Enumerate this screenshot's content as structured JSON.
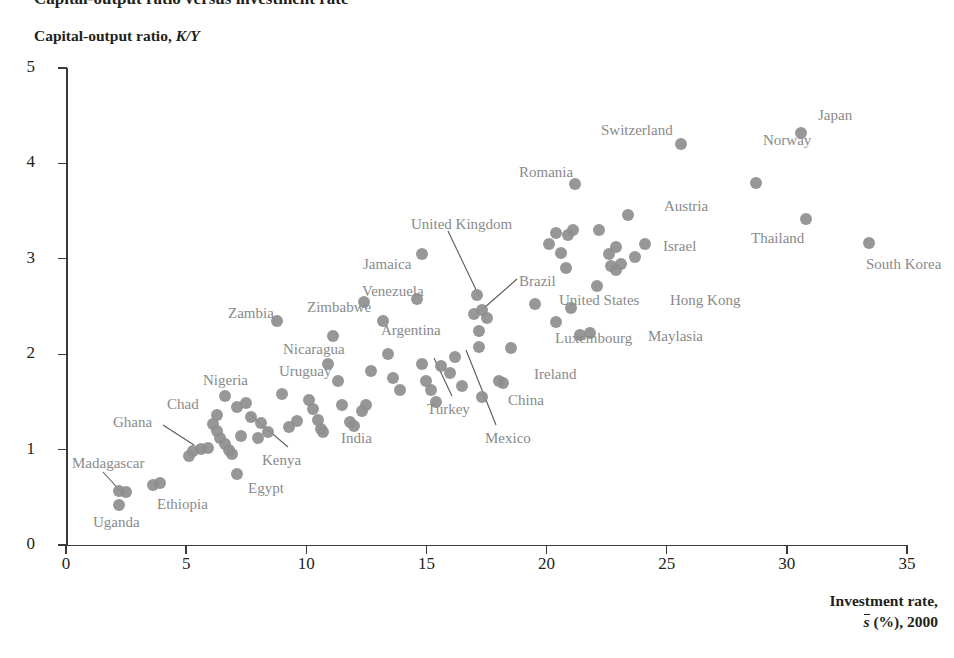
{
  "title_cut": "Capital-output ratio versus investment rate",
  "axes": {
    "ylabel_text": "Capital-output ratio, ",
    "ylabel_italic": "K/Y",
    "xlabel_line1": "Investment rate,",
    "xlabel_svar": "s",
    "xlabel_rest": " (%), 2000",
    "yticks": [
      "0",
      "1",
      "2",
      "3",
      "4",
      "5"
    ],
    "xticks": [
      "0",
      "5",
      "10",
      "15",
      "20",
      "25",
      "30",
      "35"
    ]
  },
  "style": {
    "marker_color": "#8e8e8e",
    "label_color": "#8a8a8a",
    "axis_color": "#3a3a3a",
    "text_color": "#231f20",
    "background": "#ffffff"
  },
  "chart_data": {
    "type": "scatter",
    "title": "Capital-output ratio versus investment rate",
    "xlabel": "Investment rate, s-bar (%), 2000",
    "ylabel": "Capital-output ratio, K/Y",
    "xlim": [
      0,
      35
    ],
    "ylim": [
      0,
      5
    ],
    "xticks": [
      0,
      5,
      10,
      15,
      20,
      25,
      30,
      35
    ],
    "yticks": [
      0,
      1,
      2,
      3,
      4,
      5
    ],
    "grid": false,
    "legend": "none",
    "marker": "filled-circle",
    "points": [
      {
        "label": "Uganda",
        "x": 2.2,
        "y": 0.42,
        "labeled": true
      },
      {
        "label": "Madagascar",
        "x": 2.2,
        "y": 0.57,
        "labeled": true
      },
      {
        "label": "",
        "x": 2.5,
        "y": 0.56,
        "labeled": false
      },
      {
        "label": "Ethiopia",
        "x": 3.6,
        "y": 0.63,
        "labeled": true
      },
      {
        "label": "",
        "x": 3.9,
        "y": 0.65,
        "labeled": false
      },
      {
        "label": "Ghana",
        "x": 5.3,
        "y": 0.99,
        "labeled": true
      },
      {
        "label": "",
        "x": 5.6,
        "y": 1.01,
        "labeled": false
      },
      {
        "label": "",
        "x": 5.9,
        "y": 1.02,
        "labeled": false
      },
      {
        "label": "",
        "x": 5.1,
        "y": 0.93,
        "labeled": false
      },
      {
        "label": "Chad",
        "x": 6.1,
        "y": 1.27,
        "labeled": true
      },
      {
        "label": "",
        "x": 6.3,
        "y": 1.19,
        "labeled": false
      },
      {
        "label": "",
        "x": 6.4,
        "y": 1.12,
        "labeled": false
      },
      {
        "label": "",
        "x": 6.6,
        "y": 1.06,
        "labeled": false
      },
      {
        "label": "",
        "x": 6.8,
        "y": 1.0,
        "labeled": false
      },
      {
        "label": "",
        "x": 6.9,
        "y": 0.95,
        "labeled": false
      },
      {
        "label": "Nigeria",
        "x": 6.6,
        "y": 1.56,
        "labeled": true
      },
      {
        "label": "",
        "x": 6.3,
        "y": 1.36,
        "labeled": false
      },
      {
        "label": "",
        "x": 7.1,
        "y": 1.45,
        "labeled": false
      },
      {
        "label": "Egypt",
        "x": 7.1,
        "y": 0.74,
        "labeled": true
      },
      {
        "label": "Kenya",
        "x": 7.3,
        "y": 1.14,
        "labeled": true
      },
      {
        "label": "",
        "x": 7.5,
        "y": 1.49,
        "labeled": false
      },
      {
        "label": "",
        "x": 7.7,
        "y": 1.34,
        "labeled": false
      },
      {
        "label": "",
        "x": 8.0,
        "y": 1.12,
        "labeled": false
      },
      {
        "label": "",
        "x": 8.1,
        "y": 1.28,
        "labeled": false
      },
      {
        "label": "",
        "x": 8.4,
        "y": 1.18,
        "labeled": false
      },
      {
        "label": "Zambia",
        "x": 8.8,
        "y": 2.35,
        "labeled": true
      },
      {
        "label": "",
        "x": 9.0,
        "y": 1.58,
        "labeled": false
      },
      {
        "label": "",
        "x": 9.3,
        "y": 1.24,
        "labeled": false
      },
      {
        "label": "",
        "x": 9.6,
        "y": 1.3,
        "labeled": false
      },
      {
        "label": "Uruguay",
        "x": 10.1,
        "y": 1.52,
        "labeled": true
      },
      {
        "label": "",
        "x": 10.3,
        "y": 1.43,
        "labeled": false
      },
      {
        "label": "",
        "x": 10.5,
        "y": 1.31,
        "labeled": false
      },
      {
        "label": "",
        "x": 10.6,
        "y": 1.22,
        "labeled": false
      },
      {
        "label": "",
        "x": 10.7,
        "y": 1.18,
        "labeled": false
      },
      {
        "label": "Nicaragua",
        "x": 10.9,
        "y": 1.9,
        "labeled": true
      },
      {
        "label": "Zimbabwe",
        "x": 11.1,
        "y": 2.19,
        "labeled": true
      },
      {
        "label": "",
        "x": 11.3,
        "y": 1.72,
        "labeled": false
      },
      {
        "label": "",
        "x": 11.5,
        "y": 1.47,
        "labeled": false
      },
      {
        "label": "India",
        "x": 11.8,
        "y": 1.29,
        "labeled": true
      },
      {
        "label": "",
        "x": 12.0,
        "y": 1.25,
        "labeled": false
      },
      {
        "label": "",
        "x": 12.3,
        "y": 1.4,
        "labeled": false
      },
      {
        "label": "",
        "x": 12.5,
        "y": 1.47,
        "labeled": false
      },
      {
        "label": "Venezuela",
        "x": 12.4,
        "y": 2.55,
        "labeled": true
      },
      {
        "label": "",
        "x": 12.7,
        "y": 1.82,
        "labeled": false
      },
      {
        "label": "Argentina",
        "x": 13.2,
        "y": 2.35,
        "labeled": true
      },
      {
        "label": "",
        "x": 13.4,
        "y": 2.0,
        "labeled": false
      },
      {
        "label": "",
        "x": 13.6,
        "y": 1.75,
        "labeled": false
      },
      {
        "label": "",
        "x": 13.9,
        "y": 1.62,
        "labeled": false
      },
      {
        "label": "Jamaica",
        "x": 14.8,
        "y": 3.05,
        "labeled": true
      },
      {
        "label": "",
        "x": 14.6,
        "y": 2.58,
        "labeled": false
      },
      {
        "label": "",
        "x": 14.8,
        "y": 1.9,
        "labeled": false
      },
      {
        "label": "",
        "x": 15.0,
        "y": 1.72,
        "labeled": false
      },
      {
        "label": "",
        "x": 15.2,
        "y": 1.62,
        "labeled": false
      },
      {
        "label": "",
        "x": 15.4,
        "y": 1.5,
        "labeled": false
      },
      {
        "label": "",
        "x": 15.6,
        "y": 1.88,
        "labeled": false
      },
      {
        "label": "Turkey",
        "x": 16.0,
        "y": 1.8,
        "labeled": true
      },
      {
        "label": "",
        "x": 16.2,
        "y": 1.97,
        "labeled": false
      },
      {
        "label": "",
        "x": 16.5,
        "y": 1.67,
        "labeled": false
      },
      {
        "label": "United Kingdom",
        "x": 17.1,
        "y": 2.62,
        "labeled": true
      },
      {
        "label": "Brazil",
        "x": 17.3,
        "y": 2.46,
        "labeled": true
      },
      {
        "label": "",
        "x": 17.0,
        "y": 2.42,
        "labeled": false
      },
      {
        "label": "",
        "x": 17.2,
        "y": 2.24,
        "labeled": false
      },
      {
        "label": "Mexico",
        "x": 17.2,
        "y": 2.08,
        "labeled": true
      },
      {
        "label": "",
        "x": 17.5,
        "y": 2.38,
        "labeled": false
      },
      {
        "label": "",
        "x": 17.3,
        "y": 1.55,
        "labeled": false
      },
      {
        "label": "China",
        "x": 18.0,
        "y": 1.72,
        "labeled": true
      },
      {
        "label": "",
        "x": 18.2,
        "y": 1.7,
        "labeled": false
      },
      {
        "label": "Ireland",
        "x": 18.5,
        "y": 2.07,
        "labeled": true
      },
      {
        "label": "",
        "x": 19.5,
        "y": 2.53,
        "labeled": false
      },
      {
        "label": "",
        "x": 20.1,
        "y": 3.15,
        "labeled": false
      },
      {
        "label": "",
        "x": 20.4,
        "y": 3.27,
        "labeled": false
      },
      {
        "label": "",
        "x": 20.6,
        "y": 3.06,
        "labeled": false
      },
      {
        "label": "",
        "x": 20.9,
        "y": 3.25,
        "labeled": false
      },
      {
        "label": "",
        "x": 21.1,
        "y": 3.3,
        "labeled": false
      },
      {
        "label": "",
        "x": 20.8,
        "y": 2.9,
        "labeled": false
      },
      {
        "label": "Romania",
        "x": 21.2,
        "y": 3.78,
        "labeled": true
      },
      {
        "label": "United States",
        "x": 21.0,
        "y": 2.48,
        "labeled": true
      },
      {
        "label": "Brazil-pt",
        "x": 20.4,
        "y": 2.34,
        "labeled": false
      },
      {
        "label": "Luxembourg",
        "x": 21.4,
        "y": 2.2,
        "labeled": true
      },
      {
        "label": "",
        "x": 22.2,
        "y": 3.3,
        "labeled": false
      },
      {
        "label": "",
        "x": 22.6,
        "y": 3.05,
        "labeled": false
      },
      {
        "label": "",
        "x": 22.9,
        "y": 3.12,
        "labeled": false
      },
      {
        "label": "",
        "x": 22.7,
        "y": 2.92,
        "labeled": false
      },
      {
        "label": "",
        "x": 23.1,
        "y": 2.95,
        "labeled": false
      },
      {
        "label": "",
        "x": 22.9,
        "y": 2.88,
        "labeled": false
      },
      {
        "label": "Hong Kong",
        "x": 22.1,
        "y": 2.71,
        "labeled": true
      },
      {
        "label": "Maylasia",
        "x": 21.8,
        "y": 2.22,
        "labeled": true
      },
      {
        "label": "Austria",
        "x": 23.4,
        "y": 3.46,
        "labeled": true
      },
      {
        "label": "Israel",
        "x": 23.7,
        "y": 3.02,
        "labeled": true
      },
      {
        "label": "",
        "x": 24.1,
        "y": 3.15,
        "labeled": false
      },
      {
        "label": "Switzerland",
        "x": 25.6,
        "y": 4.2,
        "labeled": true
      },
      {
        "label": "Norway",
        "x": 28.7,
        "y": 3.79,
        "labeled": true
      },
      {
        "label": "Thailand",
        "x": 30.8,
        "y": 3.42,
        "labeled": true
      },
      {
        "label": "Japan",
        "x": 30.6,
        "y": 4.32,
        "labeled": true
      },
      {
        "label": "South Korea",
        "x": 33.4,
        "y": 3.17,
        "labeled": true
      }
    ],
    "annotations": [
      {
        "text": "Madagascar",
        "leader": true
      },
      {
        "text": "Ghana",
        "leader": true
      },
      {
        "text": "Kenya",
        "leader": true
      },
      {
        "text": "United Kingdom",
        "leader": true
      },
      {
        "text": "Brazil",
        "leader": true
      },
      {
        "text": "Turkey",
        "leader": true
      },
      {
        "text": "Mexico",
        "leader": true
      }
    ]
  },
  "point_labels": [
    {
      "name": "Madagascar",
      "text": "Madagascar",
      "left": 72,
      "top": 455
    },
    {
      "name": "Uganda",
      "text": "Uganda",
      "left": 93,
      "top": 514
    },
    {
      "name": "Ethiopia",
      "text": "Ethiopia",
      "left": 157,
      "top": 496
    },
    {
      "name": "Ghana",
      "text": "Ghana",
      "left": 113,
      "top": 414
    },
    {
      "name": "Chad",
      "text": "Chad",
      "left": 167,
      "top": 396
    },
    {
      "name": "Nigeria",
      "text": "Nigeria",
      "left": 203,
      "top": 372
    },
    {
      "name": "Kenya",
      "text": "Kenya",
      "left": 262,
      "top": 452
    },
    {
      "name": "Egypt",
      "text": "Egypt",
      "left": 248,
      "top": 480
    },
    {
      "name": "Zambia",
      "text": "Zambia",
      "left": 228,
      "top": 305
    },
    {
      "name": "Uruguay",
      "text": "Uruguay",
      "left": 279,
      "top": 363
    },
    {
      "name": "Nicaragua",
      "text": "Nicaragua",
      "left": 283,
      "top": 341
    },
    {
      "name": "Zimbabwe",
      "text": "Zimbabwe",
      "left": 307,
      "top": 299
    },
    {
      "name": "India",
      "text": "India",
      "left": 341,
      "top": 430
    },
    {
      "name": "Venezuela",
      "text": "Venezuela",
      "left": 362,
      "top": 283
    },
    {
      "name": "Argentina",
      "text": "Argentina",
      "left": 381,
      "top": 322
    },
    {
      "name": "Jamaica",
      "text": "Jamaica",
      "left": 363,
      "top": 256
    },
    {
      "name": "Turkey",
      "text": "Turkey",
      "left": 427,
      "top": 401
    },
    {
      "name": "United Kingdom",
      "text": "United Kingdom",
      "left": 411,
      "top": 216
    },
    {
      "name": "Brazil",
      "text": "Brazil",
      "left": 519,
      "top": 273
    },
    {
      "name": "Mexico",
      "text": "Mexico",
      "left": 485,
      "top": 430
    },
    {
      "name": "China",
      "text": "China",
      "left": 508,
      "top": 392
    },
    {
      "name": "Ireland",
      "text": "Ireland",
      "left": 534,
      "top": 366
    },
    {
      "name": "United States",
      "text": "United States",
      "left": 559,
      "top": 292
    },
    {
      "name": "Luxembourg",
      "text": "Luxembourg",
      "left": 555,
      "top": 330
    },
    {
      "name": "Romania",
      "text": "Romania",
      "left": 519,
      "top": 164
    },
    {
      "name": "Maylasia",
      "text": "Maylasia",
      "left": 648,
      "top": 328
    },
    {
      "name": "Hong Kong",
      "text": "Hong Kong",
      "left": 670,
      "top": 292
    },
    {
      "name": "Israel",
      "text": "Israel",
      "left": 663,
      "top": 238
    },
    {
      "name": "Austria",
      "text": "Austria",
      "left": 664,
      "top": 198
    },
    {
      "name": "Switzerland",
      "text": "Switzerland",
      "left": 601,
      "top": 122
    },
    {
      "name": "Norway",
      "text": "Norway",
      "left": 763,
      "top": 132
    },
    {
      "name": "Thailand",
      "text": "Thailand",
      "left": 751,
      "top": 230
    },
    {
      "name": "Japan",
      "text": "Japan",
      "left": 818,
      "top": 107
    },
    {
      "name": "South Korea",
      "text": "South Korea",
      "left": 866,
      "top": 256
    }
  ],
  "leaders": [
    {
      "name": "leader-madagascar",
      "x1": 103,
      "y1": 472,
      "x2": 123,
      "y2": 494
    },
    {
      "name": "leader-ghana",
      "x1": 163,
      "y1": 425,
      "x2": 194,
      "y2": 445
    },
    {
      "name": "leader-kenya",
      "x1": 288,
      "y1": 447,
      "x2": 248,
      "y2": 413
    },
    {
      "name": "leader-united-kingdom",
      "x1": 448,
      "y1": 231,
      "x2": 479,
      "y2": 296
    },
    {
      "name": "leader-brazil",
      "x1": 517,
      "y1": 279,
      "x2": 484,
      "y2": 308
    },
    {
      "name": "leader-turkey",
      "x1": 452,
      "y1": 396,
      "x2": 434,
      "y2": 358
    },
    {
      "name": "leader-mexico",
      "x1": 496,
      "y1": 425,
      "x2": 466,
      "y2": 350
    }
  ]
}
